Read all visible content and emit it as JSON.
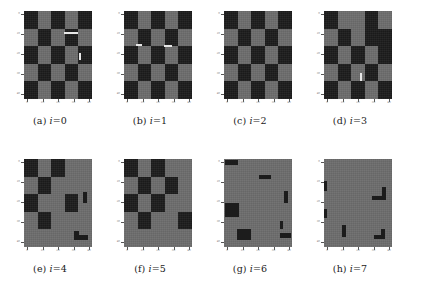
{
  "figure": {
    "type": "image-grid",
    "rows": 2,
    "columns": 4
  },
  "colors": {
    "dark_cell": "#1c1c1c",
    "light_cell": "#6d6d6d",
    "streak": "#e8e8e8",
    "background": "#ffffff",
    "tick": "#777777"
  },
  "axes": {
    "y_ticks": [
      "0",
      "10",
      "20",
      "30",
      "40"
    ],
    "x_ticks": [
      "0",
      "10",
      "20",
      "30",
      "40"
    ]
  },
  "panels": [
    {
      "label_prefix": "(a)",
      "label_var": "i",
      "label_value": "=0",
      "caption": "(a) i=0",
      "pattern": "checkerboard",
      "grid": [
        [
          "dark",
          "light",
          "dark",
          "light",
          "dark"
        ],
        [
          "light",
          "dark",
          "light",
          "dark",
          "light"
        ],
        [
          "dark",
          "light",
          "dark",
          "light",
          "dark"
        ],
        [
          "light",
          "dark",
          "light",
          "dark",
          "light"
        ],
        [
          "dark",
          "light",
          "dark",
          "light",
          "dark"
        ]
      ],
      "streaks": [
        {
          "left": 40,
          "top": 21,
          "width": 14,
          "height": 2
        },
        {
          "left": 55,
          "top": 42,
          "width": 2,
          "height": 7
        }
      ],
      "blotches": []
    },
    {
      "label_prefix": "(b)",
      "label_var": "i",
      "label_value": "=1",
      "caption": "(b) i=1",
      "pattern": "checkerboard",
      "grid": [
        [
          "dark",
          "light",
          "dark",
          "light",
          "dark"
        ],
        [
          "light",
          "dark",
          "light",
          "dark",
          "light"
        ],
        [
          "dark",
          "light",
          "dark",
          "light",
          "dark"
        ],
        [
          "light",
          "dark",
          "light",
          "dark",
          "light"
        ],
        [
          "dark",
          "light",
          "dark",
          "light",
          "dark"
        ]
      ],
      "streaks": [
        {
          "left": 12,
          "top": 33,
          "width": 6,
          "height": 2
        },
        {
          "left": 40,
          "top": 34,
          "width": 8,
          "height": 2
        }
      ],
      "blotches": []
    },
    {
      "label_prefix": "(c)",
      "label_var": "i",
      "label_value": "=2",
      "caption": "(c) i=2",
      "pattern": "checkerboard",
      "grid": [
        [
          "dark",
          "light",
          "dark",
          "light",
          "dark"
        ],
        [
          "light",
          "dark",
          "light",
          "dark",
          "light"
        ],
        [
          "dark",
          "light",
          "dark",
          "light",
          "dark"
        ],
        [
          "light",
          "dark",
          "light",
          "dark",
          "light"
        ],
        [
          "dark",
          "light",
          "dark",
          "light",
          "dark"
        ]
      ],
      "streaks": [],
      "blotches": []
    },
    {
      "label_prefix": "(d)",
      "label_var": "i",
      "label_value": "=3",
      "caption": "(d) i=3",
      "pattern": "checkerboard",
      "grid": [
        [
          "dark",
          "light",
          "light",
          "dark",
          "light"
        ],
        [
          "light",
          "dark",
          "light",
          "dark",
          "dark"
        ],
        [
          "dark",
          "light",
          "dark",
          "light",
          "dark"
        ],
        [
          "light",
          "dark",
          "light",
          "dark",
          "light"
        ],
        [
          "dark",
          "light",
          "dark",
          "light",
          "dark"
        ]
      ],
      "streaks": [
        {
          "left": 36,
          "top": 62,
          "width": 2,
          "height": 8
        }
      ],
      "blotches": []
    },
    {
      "label_prefix": "(e)",
      "label_var": "i",
      "label_value": "=4",
      "caption": "(e) i=4",
      "pattern": "degraded-checkerboard",
      "grid": [
        [
          "dark",
          "light",
          "dark",
          "light",
          "light"
        ],
        [
          "light",
          "dark",
          "light",
          "light",
          "light"
        ],
        [
          "dark",
          "light",
          "light",
          "dark",
          "light"
        ],
        [
          "light",
          "dark",
          "light",
          "light",
          "light"
        ],
        [
          "light",
          "light",
          "light",
          "light",
          "light"
        ]
      ],
      "streaks": [],
      "blotches": [
        {
          "left": 59,
          "top": 33,
          "width": 4,
          "height": 11
        },
        {
          "left": 50,
          "top": 72,
          "width": 5,
          "height": 9
        },
        {
          "left": 55,
          "top": 76,
          "width": 9,
          "height": 5
        }
      ]
    },
    {
      "label_prefix": "(f)",
      "label_var": "i",
      "label_value": "=5",
      "caption": "(f) i=5",
      "pattern": "degraded-checkerboard",
      "grid": [
        [
          "dark",
          "light",
          "dark",
          "light",
          "light"
        ],
        [
          "light",
          "dark",
          "light",
          "dark",
          "light"
        ],
        [
          "dark",
          "light",
          "dark",
          "light",
          "light"
        ],
        [
          "light",
          "dark",
          "light",
          "light",
          "dark"
        ],
        [
          "light",
          "light",
          "light",
          "light",
          "light"
        ]
      ],
      "streaks": [],
      "blotches": []
    },
    {
      "label_prefix": "(g)",
      "label_var": "i",
      "label_value": "=6",
      "caption": "(g) i=6",
      "pattern": "near-uniform",
      "grid": [
        [
          "light",
          "light",
          "light",
          "light",
          "light"
        ],
        [
          "light",
          "light",
          "light",
          "light",
          "light"
        ],
        [
          "light",
          "light",
          "light",
          "light",
          "light"
        ],
        [
          "light",
          "light",
          "light",
          "light",
          "light"
        ],
        [
          "light",
          "light",
          "light",
          "light",
          "light"
        ]
      ],
      "streaks": [],
      "blotches": [
        {
          "left": 1,
          "top": 1,
          "width": 13,
          "height": 5
        },
        {
          "left": 35,
          "top": 16,
          "width": 12,
          "height": 4
        },
        {
          "left": 60,
          "top": 32,
          "width": 4,
          "height": 12
        },
        {
          "left": 1,
          "top": 44,
          "width": 14,
          "height": 14
        },
        {
          "left": 13,
          "top": 70,
          "width": 14,
          "height": 11
        },
        {
          "left": 56,
          "top": 74,
          "width": 11,
          "height": 5
        },
        {
          "left": 56,
          "top": 62,
          "width": 3,
          "height": 8
        }
      ]
    },
    {
      "label_prefix": "(h)",
      "label_var": "i",
      "label_value": "=7",
      "caption": "(h) i=7",
      "pattern": "near-uniform",
      "grid": [
        [
          "light",
          "light",
          "light",
          "light",
          "light"
        ],
        [
          "light",
          "light",
          "light",
          "light",
          "light"
        ],
        [
          "light",
          "light",
          "light",
          "light",
          "light"
        ],
        [
          "light",
          "light",
          "light",
          "light",
          "light"
        ],
        [
          "light",
          "light",
          "light",
          "light",
          "light"
        ]
      ],
      "streaks": [],
      "blotches": [
        {
          "left": 0,
          "top": 22,
          "width": 3,
          "height": 10
        },
        {
          "left": 58,
          "top": 28,
          "width": 4,
          "height": 9
        },
        {
          "left": 48,
          "top": 37,
          "width": 14,
          "height": 4
        },
        {
          "left": 0,
          "top": 50,
          "width": 3,
          "height": 9
        },
        {
          "left": 18,
          "top": 66,
          "width": 4,
          "height": 12
        },
        {
          "left": 50,
          "top": 76,
          "width": 11,
          "height": 4
        },
        {
          "left": 57,
          "top": 70,
          "width": 4,
          "height": 7
        }
      ]
    }
  ]
}
